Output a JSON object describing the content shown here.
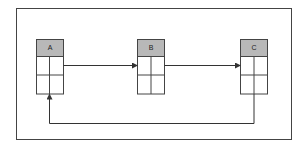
{
  "diagram": {
    "type": "flow",
    "colors": {
      "border": "#444444",
      "header_fill": "#b8b8b8",
      "cell_fill": "#ffffff",
      "line": "#333333"
    },
    "nodes": [
      {
        "id": "A",
        "label": "A",
        "rows": 2,
        "cols": 2
      },
      {
        "id": "B",
        "label": "B",
        "rows": 2,
        "cols": 2
      },
      {
        "id": "C",
        "label": "C",
        "rows": 2,
        "cols": 2
      }
    ],
    "edges": [
      {
        "from": "A",
        "to": "B"
      },
      {
        "from": "B",
        "to": "C"
      },
      {
        "from": "C",
        "to": "A",
        "route": "below"
      }
    ]
  }
}
